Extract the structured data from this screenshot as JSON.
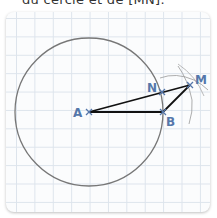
{
  "caption": "du cercle et de [MN].",
  "figure": {
    "points": [
      {
        "name": "A",
        "label": "A"
      },
      {
        "name": "N",
        "label": "N"
      },
      {
        "name": "B",
        "label": "B"
      },
      {
        "name": "M",
        "label": "M"
      }
    ],
    "segments": [
      "AM",
      "AB",
      "BM"
    ],
    "circle": {
      "center": "A",
      "through": "B"
    },
    "arcs": [
      "arc centered A through M",
      "arc centered B through M"
    ],
    "colors": {
      "point_label": "#5577aa",
      "segment": "#111111",
      "circle": "#777777",
      "grid": "#dde4ec"
    }
  }
}
